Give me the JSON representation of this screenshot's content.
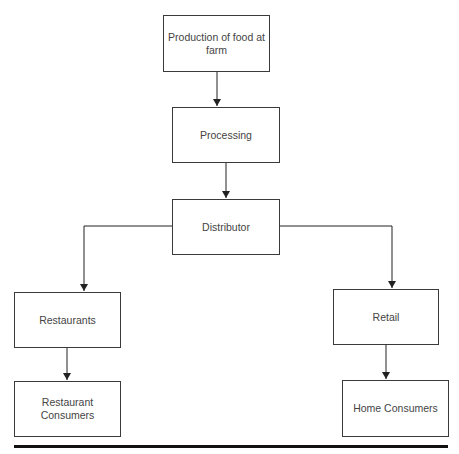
{
  "diagram": {
    "type": "flowchart",
    "nodes": [
      {
        "id": "production",
        "label": "Production of food at farm"
      },
      {
        "id": "processing",
        "label": "Processing"
      },
      {
        "id": "distributor",
        "label": "Distributor"
      },
      {
        "id": "restaurants",
        "label": "Restaurants"
      },
      {
        "id": "retail",
        "label": "Retail"
      },
      {
        "id": "restaurant_consumers",
        "label": "Restaurant Consumers"
      },
      {
        "id": "home_consumers",
        "label": "Home Consumers"
      }
    ],
    "edges": [
      {
        "from": "production",
        "to": "processing"
      },
      {
        "from": "processing",
        "to": "distributor"
      },
      {
        "from": "distributor",
        "to": "restaurants"
      },
      {
        "from": "distributor",
        "to": "retail"
      },
      {
        "from": "restaurants",
        "to": "restaurant_consumers"
      },
      {
        "from": "retail",
        "to": "home_consumers"
      }
    ]
  },
  "labels": {
    "production": "Production of food at farm",
    "processing": "Processing",
    "distributor": "Distributor",
    "restaurants": "Restaurants",
    "retail": "Retail",
    "restaurant_consumers": "Restaurant Consumers",
    "home_consumers": "Home Consumers"
  },
  "colors": {
    "box_border": "#3a3a3a",
    "text": "#444444",
    "arrow": "#222222",
    "rule": "#111111"
  }
}
